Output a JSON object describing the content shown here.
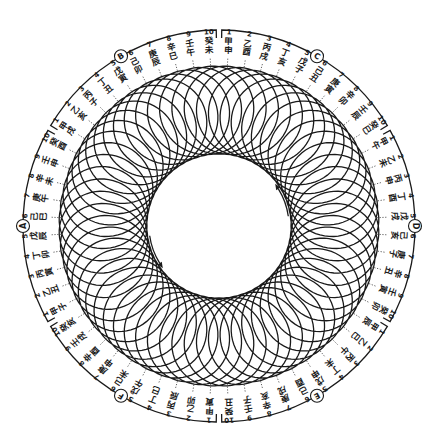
{
  "diagram": {
    "title": "",
    "center": [
      219,
      226
    ],
    "loop_count": 60,
    "inner_radius": 72,
    "outer_loop_radius": 160,
    "label_radius": 183,
    "bracket_radius": 196,
    "stroke_color": "#1a1a1a",
    "background": "#ffffff",
    "arrows": [
      {
        "name": "arrow-upper-right",
        "direction": "counterclockwise",
        "at_angle_deg": 20
      },
      {
        "name": "arrow-lower-left",
        "direction": "counterclockwise",
        "at_angle_deg": 200
      }
    ]
  },
  "markers": [
    {
      "letter": "D",
      "angle_deg": 0
    },
    {
      "letter": "C",
      "angle_deg": 60
    },
    {
      "letter": "B",
      "angle_deg": 120
    },
    {
      "letter": "A",
      "angle_deg": 180
    },
    {
      "letter": "F",
      "angle_deg": 240
    },
    {
      "letter": "E",
      "angle_deg": 300
    }
  ],
  "sectors": [
    {
      "marker": "C",
      "start_angle_deg": 87,
      "labels": [
        {
          "n": "1",
          "text": "甲申"
        },
        {
          "n": "2",
          "text": "乙酉"
        },
        {
          "n": "3",
          "text": "丙戌"
        },
        {
          "n": "4",
          "text": "丁亥"
        },
        {
          "n": "5",
          "text": "戊子"
        },
        {
          "n": "6",
          "text": "己丑"
        },
        {
          "n": "7",
          "text": "庚寅"
        },
        {
          "n": "8",
          "text": "辛卯"
        },
        {
          "n": "9",
          "text": "壬辰"
        },
        {
          "n": "10",
          "text": "癸巳"
        }
      ]
    },
    {
      "marker": "D",
      "start_angle_deg": 27,
      "labels": [
        {
          "n": "1",
          "text": "甲午"
        },
        {
          "n": "2",
          "text": "乙未"
        },
        {
          "n": "3",
          "text": "丙申"
        },
        {
          "n": "4",
          "text": "丁酉"
        },
        {
          "n": "5",
          "text": "戊戌"
        },
        {
          "n": "6",
          "text": "己亥"
        },
        {
          "n": "7",
          "text": "庚子"
        },
        {
          "n": "8",
          "text": "辛丑"
        },
        {
          "n": "9",
          "text": "壬寅"
        },
        {
          "n": "10",
          "text": "癸卯"
        }
      ]
    },
    {
      "marker": "E",
      "start_angle_deg": -33,
      "labels": [
        {
          "n": "1",
          "text": "甲辰"
        },
        {
          "n": "2",
          "text": "乙巳"
        },
        {
          "n": "3",
          "text": "丙午"
        },
        {
          "n": "4",
          "text": "丁未"
        },
        {
          "n": "5",
          "text": "戊申"
        },
        {
          "n": "6",
          "text": "己酉"
        },
        {
          "n": "7",
          "text": "庚戌"
        },
        {
          "n": "8",
          "text": "辛亥"
        },
        {
          "n": "9",
          "text": "壬子"
        },
        {
          "n": "10",
          "text": "癸丑"
        }
      ]
    },
    {
      "marker": "F",
      "start_angle_deg": -93,
      "labels": [
        {
          "n": "1",
          "text": "甲寅"
        },
        {
          "n": "2",
          "text": "乙卯"
        },
        {
          "n": "3",
          "text": "丙辰"
        },
        {
          "n": "4",
          "text": "丁巳"
        },
        {
          "n": "5",
          "text": "戊午"
        },
        {
          "n": "6",
          "text": "己未"
        },
        {
          "n": "7",
          "text": "庚申"
        },
        {
          "n": "8",
          "text": "辛酉"
        },
        {
          "n": "9",
          "text": "壬戌"
        },
        {
          "n": "10",
          "text": "癸亥"
        }
      ]
    },
    {
      "marker": "A",
      "start_angle_deg": -153,
      "labels": [
        {
          "n": "1",
          "text": "甲子"
        },
        {
          "n": "2",
          "text": "乙丑"
        },
        {
          "n": "3",
          "text": "丙寅"
        },
        {
          "n": "4",
          "text": "丁卯"
        },
        {
          "n": "5",
          "text": "戊辰"
        },
        {
          "n": "6",
          "text": "己巳"
        },
        {
          "n": "7",
          "text": "庚午"
        },
        {
          "n": "8",
          "text": "辛未"
        },
        {
          "n": "9",
          "text": "壬申"
        },
        {
          "n": "10",
          "text": "癸酉"
        }
      ]
    },
    {
      "marker": "B",
      "start_angle_deg": -213,
      "labels": [
        {
          "n": "1",
          "text": "甲戌"
        },
        {
          "n": "2",
          "text": "乙亥"
        },
        {
          "n": "3",
          "text": "丙子"
        },
        {
          "n": "4",
          "text": "丁丑"
        },
        {
          "n": "5",
          "text": "戊寅"
        },
        {
          "n": "6",
          "text": "己卯"
        },
        {
          "n": "7",
          "text": "庚辰"
        },
        {
          "n": "8",
          "text": "辛巳"
        },
        {
          "n": "9",
          "text": "壬午"
        },
        {
          "n": "10",
          "text": "癸未"
        }
      ]
    }
  ]
}
